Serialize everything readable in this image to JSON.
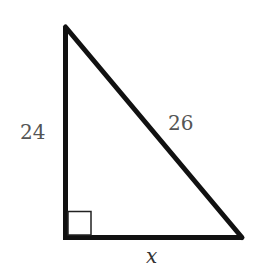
{
  "figure": {
    "type": "right-triangle",
    "colors": {
      "stroke": "#111111",
      "label": "#555555",
      "background": "#ffffff"
    },
    "vertices": {
      "top": {
        "x": 65.5,
        "y": 27
      },
      "right_angle": {
        "x": 65.5,
        "y": 237.5
      },
      "bottom_right": {
        "x": 242,
        "y": 237.5
      }
    },
    "right_angle_marker": {
      "size": 23
    },
    "labels": {
      "vertical_leg": "24",
      "hypotenuse": "26",
      "horizontal_leg": "x"
    }
  }
}
